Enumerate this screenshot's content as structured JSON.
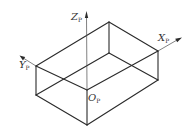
{
  "diagram": {
    "type": "isometric-box-with-coordinate-frame",
    "colors": {
      "line": "#2a2a2a",
      "axis": "#4a4a4a",
      "background": "#ffffff"
    },
    "vertices": {
      "A": [
        109,
        22
      ],
      "B": [
        158,
        51
      ],
      "C": [
        36,
        66
      ],
      "D": [
        87,
        90
      ],
      "E": [
        109,
        53
      ],
      "F": [
        158,
        80
      ],
      "G": [
        36,
        95
      ],
      "H": [
        87,
        125
      ]
    },
    "edges": [
      [
        "A",
        "B"
      ],
      [
        "A",
        "C"
      ],
      [
        "A",
        "E"
      ],
      [
        "B",
        "F"
      ],
      [
        "C",
        "G"
      ],
      [
        "D",
        "H"
      ],
      [
        "C",
        "D"
      ],
      [
        "D",
        "B"
      ],
      [
        "E",
        "G"
      ],
      [
        "E",
        "F"
      ],
      [
        "G",
        "H"
      ],
      [
        "H",
        "F"
      ]
    ],
    "axes": {
      "z": {
        "label": "Z",
        "subscript": "P",
        "from": [
          87,
          90
        ],
        "to": [
          86,
          12
        ]
      },
      "x": {
        "label": "X",
        "subscript": "P",
        "from": [
          158,
          51
        ],
        "to": [
          181,
          38
        ]
      },
      "y": {
        "label": "Y",
        "subscript": "P",
        "from": [
          36,
          66
        ],
        "to": [
          20,
          56
        ]
      }
    },
    "origin": {
      "label": "O",
      "subscript": "P"
    }
  }
}
